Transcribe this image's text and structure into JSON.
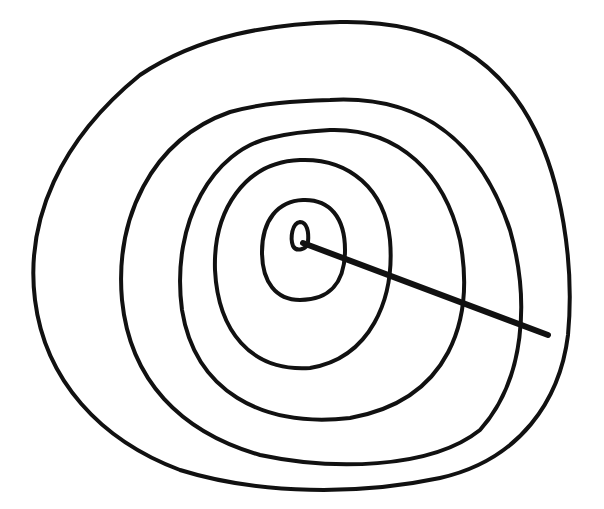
{
  "drawing": {
    "description": "Hand-drawn concentric rings with a radial line from the center",
    "stroke_color": "#111111",
    "background_color": "#ffffff",
    "stroke_width": 4,
    "center": [
      300,
      238
    ],
    "rings": [
      {
        "name": "ring-1",
        "d": "M300,222 C307,222 309,232 308,242 C307,250 296,252 293,246 C290,238 292,223 300,222 Z"
      },
      {
        "name": "ring-2",
        "d": "M303,200 C330,199 345,218 345,250 C345,282 330,300 300,300 C276,300 262,282 262,252 C262,220 278,201 303,200 Z"
      },
      {
        "name": "ring-3",
        "d": "M300,160 C350,158 385,190 390,240 C395,300 370,358 310,368 C250,372 218,330 215,270 C213,210 245,162 300,160 Z"
      },
      {
        "name": "ring-4",
        "d": "M330,130 C400,128 445,175 460,240 C475,320 450,400 350,418 C260,428 195,390 182,310 C170,220 215,150 270,138 C290,133 310,131 330,130 Z"
      },
      {
        "name": "ring-5",
        "d": "M330,100 C420,95 480,140 510,230 C530,300 525,380 480,430 C430,470 330,470 260,455 C180,432 130,380 122,300 C115,220 150,140 230,112 C262,103 296,101 330,100 Z"
      },
      {
        "name": "ring-6",
        "d": "M340,22 C440,20 500,60 535,130 C560,180 575,260 568,335 C560,400 520,460 440,478 C360,495 260,495 180,470 C100,440 45,380 35,300 C25,220 60,140 140,75 C200,35 270,24 340,22 Z"
      }
    ],
    "radial_line": {
      "x1": 303,
      "y1": 243,
      "x2": 548,
      "y2": 335,
      "stroke_width": 6
    }
  }
}
